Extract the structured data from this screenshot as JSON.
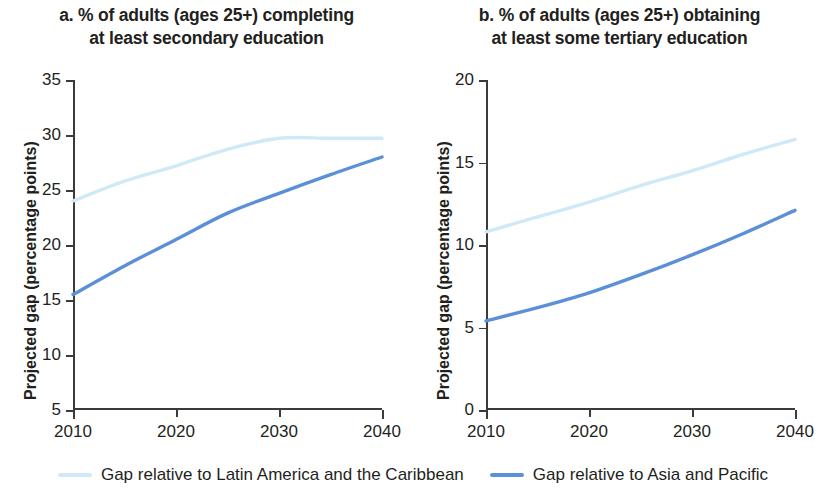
{
  "legend": {
    "items": [
      {
        "label": "Gap relative to Latin America and the Caribbean",
        "color": "#cfeaf6"
      },
      {
        "label": "Gap relative to Asia and Pacific",
        "color": "#5b8fd8"
      }
    ]
  },
  "panels": {
    "a": {
      "title": "a. % of adults (ages 25+) completing\nat least secondary education",
      "ylabel": "Projected gap (percentage points)",
      "yticks": [
        "5",
        "10",
        "15",
        "20",
        "25",
        "30",
        "35"
      ],
      "xticks": [
        "2010",
        "2020",
        "2030",
        "2040"
      ]
    },
    "b": {
      "title": "b. % of adults (ages 25+) obtaining\nat least some tertiary education",
      "ylabel": "Projected gap (percentage points)",
      "yticks": [
        "0",
        "5",
        "10",
        "15",
        "20"
      ],
      "xticks": [
        "2010",
        "2020",
        "2030",
        "2040"
      ]
    }
  },
  "chart_data": [
    {
      "type": "line",
      "panel": "a",
      "title": "a. % of adults (ages 25+) completing at least secondary education",
      "xlabel": "",
      "ylabel": "Projected gap (percentage points)",
      "xlim": [
        2010,
        2040
      ],
      "ylim": [
        5,
        35
      ],
      "yticks": [
        5,
        10,
        15,
        20,
        25,
        30,
        35
      ],
      "xticks": [
        2010,
        2020,
        2030,
        2040
      ],
      "grid": false,
      "legend_position": "bottom",
      "x": [
        2010,
        2015,
        2020,
        2025,
        2030,
        2035,
        2040
      ],
      "series": [
        {
          "name": "Gap relative to Latin America and the Caribbean",
          "color": "#cfeaf6",
          "values": [
            24.0,
            25.8,
            27.2,
            28.7,
            29.7,
            29.7,
            29.7
          ]
        },
        {
          "name": "Gap relative to Asia and Pacific",
          "color": "#5b8fd8",
          "values": [
            15.5,
            18.1,
            20.5,
            22.9,
            24.7,
            26.4,
            28.0
          ]
        }
      ]
    },
    {
      "type": "line",
      "panel": "b",
      "title": "b. % of adults (ages 25+) obtaining at least some tertiary education",
      "xlabel": "",
      "ylabel": "Projected gap (percentage points)",
      "xlim": [
        2010,
        2040
      ],
      "ylim": [
        0,
        20
      ],
      "yticks": [
        0,
        5,
        10,
        15,
        20
      ],
      "xticks": [
        2010,
        2020,
        2030,
        2040
      ],
      "grid": false,
      "legend_position": "bottom",
      "x": [
        2010,
        2015,
        2020,
        2025,
        2030,
        2035,
        2040
      ],
      "series": [
        {
          "name": "Gap relative to Latin America and the Caribbean",
          "color": "#cfeaf6",
          "values": [
            10.8,
            11.7,
            12.6,
            13.6,
            14.5,
            15.5,
            16.4
          ]
        },
        {
          "name": "Gap relative to Asia and Pacific",
          "color": "#5b8fd8",
          "values": [
            5.4,
            6.2,
            7.1,
            8.2,
            9.4,
            10.7,
            12.1
          ]
        }
      ]
    }
  ]
}
